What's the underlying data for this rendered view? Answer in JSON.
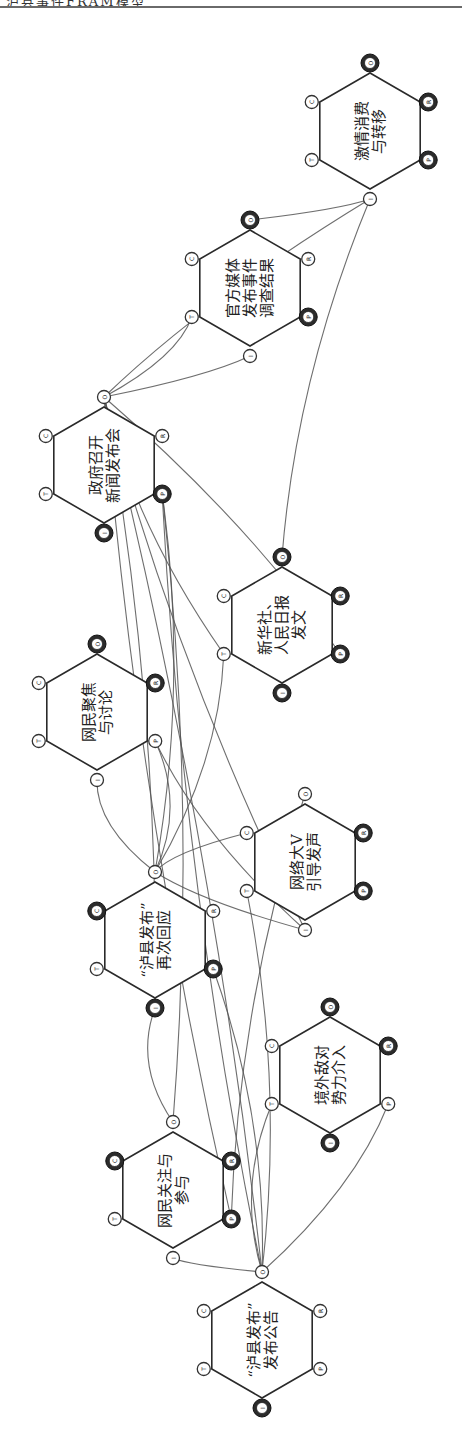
{
  "header": {
    "text": "泸县事件FRAM模型"
  },
  "diagram": {
    "type": "FRAM functional resonance model (rotated 90°)",
    "aspects": [
      "I",
      "O",
      "P",
      "R",
      "C",
      "T"
    ],
    "functions": [
      {
        "id": "f1",
        "label_lines": [
          "“泸县发布”",
          "发布公告"
        ],
        "cx": 262,
        "cy": 1340,
        "dark": [
          "I"
        ]
      },
      {
        "id": "f2",
        "label_lines": [
          "网民关注与",
          "参与"
        ],
        "cx": 173,
        "cy": 1190,
        "dark": [
          "C",
          "R",
          "P"
        ]
      },
      {
        "id": "f3",
        "label_lines": [
          "境外敌对",
          "势力介入"
        ],
        "cx": 330,
        "cy": 1075,
        "dark": [
          "O",
          "R",
          "I"
        ]
      },
      {
        "id": "f4",
        "label_lines": [
          "“泸县发布”",
          "再次回应"
        ],
        "cx": 155,
        "cy": 940,
        "dark": [
          "C",
          "P",
          "I"
        ]
      },
      {
        "id": "f5",
        "label_lines": [
          "网络大V",
          "引导发声"
        ],
        "cx": 305,
        "cy": 862,
        "dark": [
          "R",
          "P"
        ]
      },
      {
        "id": "f6",
        "label_lines": [
          "网民聚焦",
          "与讨论"
        ],
        "cx": 97,
        "cy": 712,
        "dark": [
          "O",
          "R"
        ]
      },
      {
        "id": "f7",
        "label_lines": [
          "新华社、",
          "人民日报",
          "发文"
        ],
        "cx": 282,
        "cy": 625,
        "dark": [
          "O",
          "R",
          "P",
          "I"
        ]
      },
      {
        "id": "f8",
        "label_lines": [
          "政府召开",
          "新闻发布会"
        ],
        "cx": 104,
        "cy": 465,
        "dark": [
          "I",
          "P"
        ]
      },
      {
        "id": "f9",
        "label_lines": [
          "官方媒体",
          "发布事件",
          "调查结果"
        ],
        "cx": 250,
        "cy": 288,
        "dark": [
          "O",
          "P"
        ]
      },
      {
        "id": "f10",
        "label_lines": [
          "激情消费",
          "与转移"
        ],
        "cx": 370,
        "cy": 131,
        "dark": [
          "O",
          "R",
          "P"
        ]
      }
    ],
    "couplings": [
      {
        "from": "f1.O",
        "to": "f2.I"
      },
      {
        "from": "f1.O",
        "to": "f4.P"
      },
      {
        "from": "f1.O",
        "to": "f8.P"
      },
      {
        "from": "f1.O",
        "to": "f5.T"
      },
      {
        "from": "f1.O",
        "to": "f3.T"
      },
      {
        "from": "f1.O",
        "to": "f3.P"
      },
      {
        "from": "f2.O",
        "to": "f4.I"
      },
      {
        "from": "f2.O",
        "to": "f8.P"
      },
      {
        "from": "f4.O",
        "to": "f6.I"
      },
      {
        "from": "f4.O",
        "to": "f8.P"
      },
      {
        "from": "f4.O",
        "to": "f5.I"
      },
      {
        "from": "f4.O",
        "to": "f7.T"
      },
      {
        "from": "f4.O",
        "to": "f5.C"
      },
      {
        "from": "f6.P",
        "to": "f4.O"
      },
      {
        "from": "f6.P",
        "to": "f5.I"
      },
      {
        "from": "f8.O",
        "to": "f9.I"
      },
      {
        "from": "f8.O",
        "to": "f10.I"
      },
      {
        "from": "f8.O",
        "to": "f9.T"
      },
      {
        "from": "f8.O",
        "to": "f7.T"
      },
      {
        "from": "f8.O",
        "to": "f7.P"
      },
      {
        "from": "f8.O",
        "to": "f2.P"
      },
      {
        "from": "f8.O",
        "to": "f1.O"
      },
      {
        "from": "f8.O",
        "to": "f5.I"
      },
      {
        "from": "f8.O",
        "to": "f4.I"
      },
      {
        "from": "f7.O",
        "to": "f10.I"
      },
      {
        "from": "f9.O",
        "to": "f10.I"
      },
      {
        "from": "f5.O",
        "to": "f2.P"
      }
    ]
  }
}
